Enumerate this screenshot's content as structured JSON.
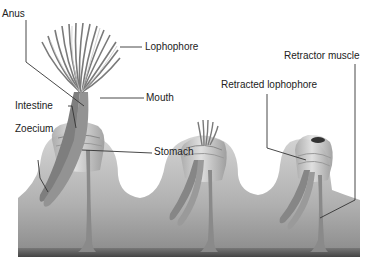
{
  "diagram": {
    "labels": {
      "anus": "Anus",
      "lophophore": "Lophophore",
      "mouth": "Mouth",
      "intestine": "Intestine",
      "zoecium": "Zoecium",
      "stomach": "Stomach",
      "retracted_lophophore": "Retracted lophophore",
      "retractor_muscle": "Retractor muscle"
    },
    "colors": {
      "body": "#b8b8b8",
      "body_dark": "#6e6e6e",
      "base": "#555555",
      "gut": "#8a8a8a",
      "leader": "#333333"
    }
  }
}
